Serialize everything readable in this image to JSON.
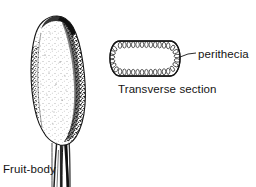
{
  "figure": {
    "type": "scientific-illustration",
    "background_color": "#ffffff",
    "ink_color": "#141414",
    "labels": {
      "fruit_body": "Fruit-body",
      "transverse_section": "Transverse section",
      "perithecia": "perithecia"
    },
    "parts": {
      "fruit_body_drawing": {
        "name": "fruit-body",
        "description": "elongated club-shaped stippled fruit-body tapering into a fibrous stalk",
        "center_x": 57,
        "top_y": 16,
        "bottom_y": 187
      },
      "transverse_section_drawing": {
        "name": "transverse-section",
        "description": "oval cross-section outlined with a ring of flask-shaped perithecia",
        "center_x": 145,
        "center_y": 58,
        "radius_x": 35,
        "radius_y": 18,
        "perithecia_count": 54
      },
      "leader_line": {
        "name": "perithecia-leader-line",
        "from_x": 180,
        "from_y": 58,
        "to_x": 196,
        "to_y": 53
      }
    }
  }
}
